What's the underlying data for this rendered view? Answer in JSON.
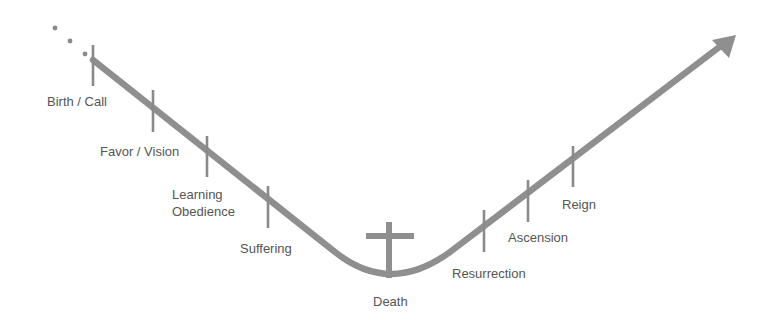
{
  "diagram": {
    "title": "",
    "colors": {
      "line": "#8f8f8f",
      "tick": "#8a8a8a",
      "cross": "#8f8f8f",
      "dots": "#8a8a8a",
      "text": "#555555",
      "background": "#ffffff"
    },
    "stages": [
      {
        "id": "birth-call",
        "label": "Birth / Call"
      },
      {
        "id": "favor-vision",
        "label": "Favor / Vision"
      },
      {
        "id": "learning-obedience",
        "label_line1": "Learning",
        "label_line2": "Obedience"
      },
      {
        "id": "suffering",
        "label": "Suffering"
      },
      {
        "id": "death",
        "label": "Death",
        "icon": "cross-icon"
      },
      {
        "id": "resurrection",
        "label": "Resurrection"
      },
      {
        "id": "ascension",
        "label": "Ascension"
      },
      {
        "id": "reign",
        "label": "Reign"
      }
    ],
    "leading_ellipsis": "...",
    "end_marker": "arrow-up-right-icon"
  }
}
